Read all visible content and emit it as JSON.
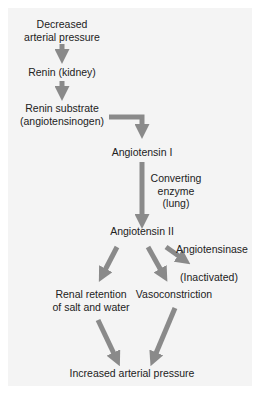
{
  "diagram": {
    "arrow_color": "#8a8a8a",
    "background_color": "#f4f4f4",
    "nodes": {
      "decreased_pressure": [
        "Decreased",
        "arterial pressure"
      ],
      "renin": "Renin (kidney)",
      "renin_substrate": [
        "Renin substrate",
        "(angiotensinogen)"
      ],
      "angiotensin_1": "Angiotensin I",
      "converting_enzyme": [
        "Converting",
        "enzyme",
        "(lung)"
      ],
      "angiotensin_2": "Angiotensin II",
      "angiotensinase": "Angiotensinase",
      "inactivated": "(Inactivated)",
      "renal_retention": [
        "Renal retention",
        "of salt and water"
      ],
      "vasoconstriction": "Vasoconstriction",
      "increased_pressure": "Increased arterial pressure"
    },
    "edges": [
      {
        "from": "Decreased arterial pressure",
        "to": "Renin (kidney)"
      },
      {
        "from": "Renin (kidney)",
        "to": "Renin substrate (angiotensinogen)"
      },
      {
        "from": "Renin substrate (angiotensinogen)",
        "to": "Angiotensin I"
      },
      {
        "from": "Angiotensin I",
        "to": "Angiotensin II",
        "label": "Converting enzyme (lung)"
      },
      {
        "from": "Angiotensin II",
        "to": "(Inactivated)",
        "label": "Angiotensinase"
      },
      {
        "from": "Angiotensin II",
        "to": "Renal retention of salt and water"
      },
      {
        "from": "Angiotensin II",
        "to": "Vasoconstriction"
      },
      {
        "from": "Renal retention of salt and water",
        "to": "Increased arterial pressure"
      },
      {
        "from": "Vasoconstriction",
        "to": "Increased arterial pressure"
      }
    ]
  }
}
